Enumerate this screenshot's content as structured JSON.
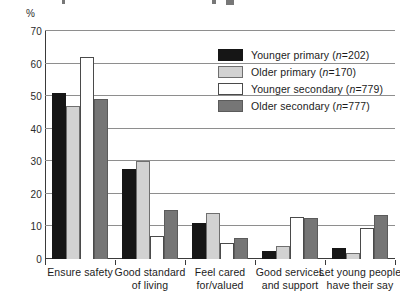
{
  "axis_unit_label": "%",
  "legend": {
    "entries": [
      {
        "label": "Younger primary (n=202)",
        "color": "#161616",
        "swatch_name": "legend-swatch-younger-primary"
      },
      {
        "label": "Older primary (n=170)",
        "color": "#d2d2d2",
        "swatch_name": "legend-swatch-older-primary"
      },
      {
        "label": "Younger secondary (n=779)",
        "color": "#ffffff",
        "swatch_name": "legend-swatch-younger-secondary"
      },
      {
        "label": "Older secondary (n=777)",
        "color": "#767676",
        "swatch_name": "legend-swatch-older-secondary"
      }
    ]
  },
  "chart_data": {
    "type": "bar",
    "title": "",
    "xlabel": "",
    "ylabel": "%",
    "ylim": [
      0,
      70
    ],
    "ytick_step": 10,
    "yticks": [
      0,
      10,
      20,
      30,
      40,
      50,
      60,
      70
    ],
    "ytick_labels": [
      "0",
      "10",
      "20",
      "30",
      "40",
      "50",
      "60",
      "70"
    ],
    "grid": true,
    "grid_axis": "y",
    "legend_position": "upper-right-inside",
    "categories": [
      "Ensure safety",
      "Good standard of living",
      "Feel cared for/valued",
      "Good services and support",
      "Let young people have their say"
    ],
    "category_lines": [
      [
        "Ensure safety"
      ],
      [
        "Good standard",
        "of living"
      ],
      [
        "Feel cared",
        "for/valued"
      ],
      [
        "Good services",
        "and support"
      ],
      [
        "Let young people",
        "have their say"
      ]
    ],
    "series": [
      {
        "name": "Younger primary (n=202)",
        "color": "#161616",
        "values": [
          51,
          27.5,
          11,
          2.5,
          3.5
        ]
      },
      {
        "name": "Older primary (n=170)",
        "color": "#d2d2d2",
        "values": [
          47,
          30,
          14,
          4,
          2
        ]
      },
      {
        "name": "Younger secondary (n=779)",
        "color": "#ffffff",
        "values": [
          62,
          7,
          5,
          13,
          9.5
        ]
      },
      {
        "name": "Older secondary (n=777)",
        "color": "#767676",
        "values": [
          49,
          15,
          6.5,
          12.5,
          13.5
        ]
      }
    ]
  }
}
